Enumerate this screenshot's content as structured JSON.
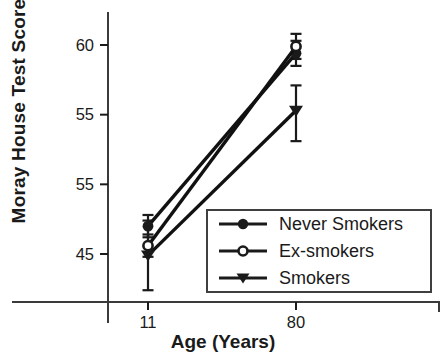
{
  "chart_data": {
    "type": "line",
    "title": "",
    "xlabel": "Age (Years)",
    "ylabel": "Moray House Test Score",
    "x": [
      11,
      80
    ],
    "xticks": [
      {
        "value": 11,
        "label": "11"
      },
      {
        "value": 80,
        "label": "80"
      }
    ],
    "yticks": [
      {
        "value": 60,
        "label": "60"
      },
      {
        "value": 55,
        "label": "55"
      },
      {
        "value": 50,
        "label": "55"
      },
      {
        "value": 45,
        "label": "45"
      }
    ],
    "ylim": [
      41.5,
      62.4
    ],
    "grid": false,
    "legend_position": "lower right",
    "ink_color": "#1a1a1a",
    "series": [
      {
        "name": "Never Smokers",
        "marker": "filled-circle",
        "color": "#111111",
        "values": [
          47.0,
          59.4
        ],
        "err_up": [
          0.8,
          0.9
        ],
        "err_down": [
          0.8,
          0.9
        ]
      },
      {
        "name": "Ex-smokers",
        "marker": "open-circle",
        "color": "#111111",
        "values": [
          45.6,
          59.9
        ],
        "err_up": [
          0.8,
          0.9
        ],
        "err_down": [
          0.8,
          0.9
        ]
      },
      {
        "name": "Smokers",
        "marker": "filled-triangle-down",
        "color": "#111111",
        "values": [
          44.9,
          55.3
        ],
        "err_up": [
          2.5,
          1.8
        ],
        "err_down": [
          2.5,
          2.2
        ]
      }
    ]
  }
}
